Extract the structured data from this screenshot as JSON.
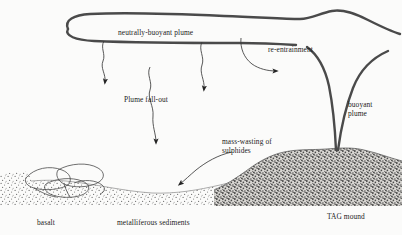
{
  "figure": {
    "background_color": "#fbfbfa",
    "ink_color": "#3a3a3a",
    "text_color": "#1b1b1b"
  },
  "labels": {
    "neutrally_buoyant_plume": "neutrally-buoyant plume",
    "re_entrainment": "re-entrainment",
    "plume_fall_out": "Plume fall-out",
    "buoyant_plume_line1": "buoyant",
    "buoyant_plume_line2": "plume",
    "mass_wasting_line1": "mass-wasting of",
    "mass_wasting_line2": "sulphides",
    "basalt": "basalt",
    "metalliferous_sediments": "metalliferous sediments",
    "tag_mound": "TAG mound"
  },
  "features": {
    "plume_envelope": "neutrally-buoyant plume outline",
    "buoyant_plume_stem": "rising buoyant plume stem",
    "fallout_arrows": 3,
    "re_entrainment_arrow": "curved arrow to the right",
    "mass_wasting_arrow": "curved arrow to the lower left",
    "seafloor": "metalliferous sediment layer",
    "pillow_basalt": "pillow basalt outcrop",
    "sulphide_mound": "TAG sulphide mound"
  }
}
